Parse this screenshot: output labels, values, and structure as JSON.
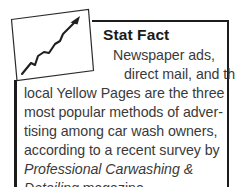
{
  "callout": {
    "kind": "stat-fact-callout",
    "heading": "Stat Fact",
    "icon": {
      "name": "upward-trend-chart-icon",
      "description": "tilted rectangular frame containing a zigzag arrow rising to the upper right"
    },
    "body_lines": [
      {
        "text": "Newspaper ads,",
        "style": "regular"
      },
      {
        "text": "direct mail, and the",
        "style": "regular"
      },
      {
        "text": "local Yellow Pages are the three",
        "style": "regular"
      },
      {
        "text": "most popular methods of adver-",
        "style": "regular"
      },
      {
        "text": "tising among car wash owners,",
        "style": "regular"
      },
      {
        "text": "according to a recent survey by",
        "style": "regular"
      },
      {
        "text": "Professional Carwashing &",
        "style": "italic"
      },
      {
        "text": "Detailing magazine.",
        "style": "italic-lead"
      }
    ],
    "full_text": "Newspaper ads, direct mail, and the local Yellow Pages are the three most popular methods of advertising among car wash owners, according to a recent survey by Professional Carwashing & Detailing magazine.",
    "source_publication": "Professional Carwashing & Detailing",
    "colors": {
      "border": "#1c1c1c",
      "heading": "#1a1a1a",
      "body": "#3a3a3a",
      "background": "#ffffff",
      "icon_stroke": "#2b2b2b"
    }
  }
}
